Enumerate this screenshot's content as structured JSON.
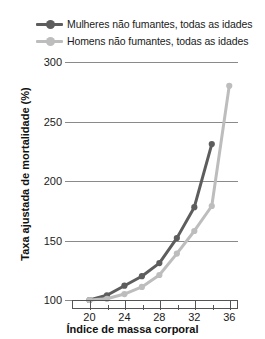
{
  "legend": {
    "position": "top-left",
    "items": [
      {
        "label": "Mulheres não fumantes, todas as idades",
        "color": "#5d5d5d",
        "key": "mulheres"
      },
      {
        "label": "Homens não fumantes, todas as idades",
        "color": "#bdbdbd",
        "key": "homens"
      }
    ]
  },
  "axes": {
    "y_title": "Taxa ajustada de mortalidade (%)",
    "x_title": "Índice de massa corporal",
    "y_ticks": [
      "100",
      "150",
      "200",
      "250",
      "300"
    ],
    "x_ticks": [
      "20",
      "24",
      "28",
      "32",
      "36"
    ]
  },
  "chart_data": {
    "type": "line",
    "title": "",
    "xlabel": "Índice de massa corporal",
    "ylabel": "Taxa ajustada de mortalidade (%)",
    "xlim": [
      18,
      37
    ],
    "ylim": [
      100,
      300
    ],
    "yticks": [
      100,
      150,
      200,
      250,
      300
    ],
    "xticks": [
      20,
      24,
      28,
      32,
      36
    ],
    "xminorticks": [
      22,
      26,
      30,
      34
    ],
    "grid": "horizontal",
    "legend_position": "above-plot",
    "series": [
      {
        "name": "Mulheres não fumantes, todas as idades",
        "color": "#5d5d5d",
        "marker": "circle",
        "x": [
          20,
          22,
          24,
          26,
          28,
          30,
          32,
          34
        ],
        "y": [
          100,
          104,
          112,
          120,
          131,
          152,
          178,
          231
        ]
      },
      {
        "name": "Homens não fumantes, todas as idades",
        "color": "#bdbdbd",
        "marker": "circle",
        "x": [
          20,
          22,
          24,
          26,
          28,
          30,
          32,
          34,
          36
        ],
        "y": [
          100,
          101,
          105,
          111,
          121,
          139,
          158,
          179,
          280
        ]
      }
    ]
  }
}
